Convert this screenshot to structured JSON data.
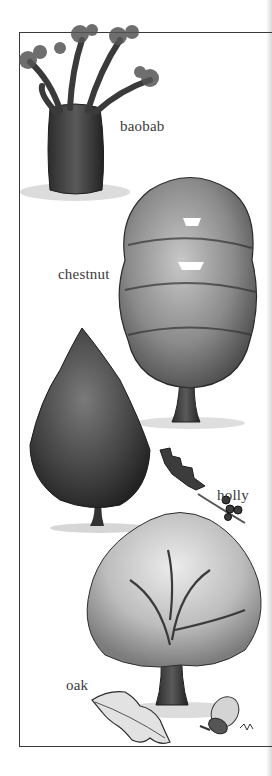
{
  "illustration": {
    "subject": "trees",
    "labels": {
      "baobab": "baobab",
      "chestnut": "chestnut",
      "holly": "holly",
      "oak": "oak"
    }
  }
}
